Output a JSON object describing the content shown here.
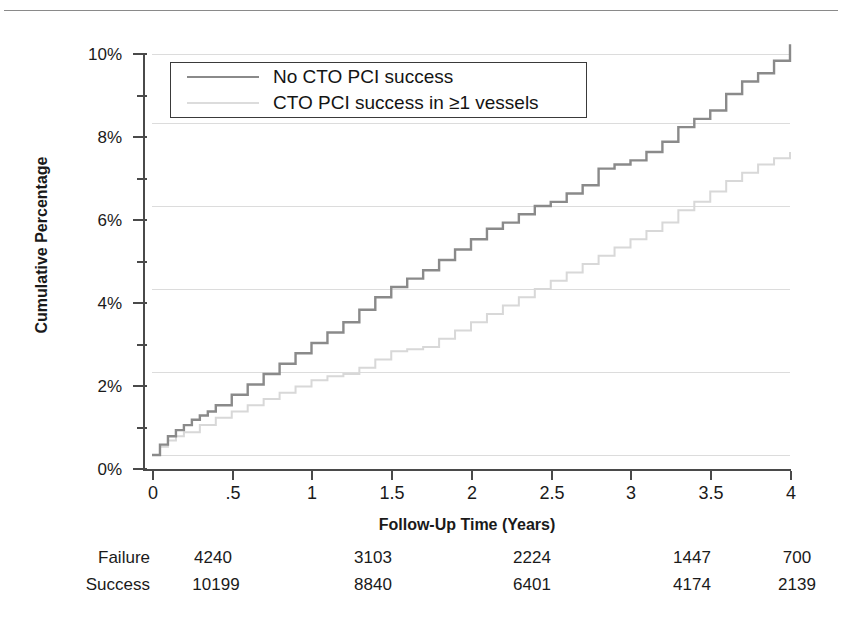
{
  "chart_data": {
    "type": "line",
    "title": "",
    "subtitle": "",
    "xlabel": "Follow-Up Time (Years)",
    "ylabel": "Cumulative Percentage",
    "xlim": [
      0,
      4
    ],
    "ylim": [
      0,
      10
    ],
    "grid": "horizontal-major-only",
    "legend_position": "top-left-inside",
    "x_ticks": [
      "0",
      ".5",
      "1",
      "1.5",
      "2",
      "2.5",
      "3",
      "3.5",
      "4"
    ],
    "x_tick_values": [
      0,
      0.5,
      1,
      1.5,
      2,
      2.5,
      3,
      3.5,
      4
    ],
    "y_ticks": [
      "0%",
      "2%",
      "4%",
      "6%",
      "8%",
      "10%"
    ],
    "y_tick_values": [
      0,
      2,
      4,
      6,
      8,
      10
    ],
    "y_minor_tick_values": [
      1,
      3,
      5,
      7,
      9
    ],
    "series": [
      {
        "name": "No CTO PCI success",
        "color": "#8a8a8a",
        "style": "step",
        "x": [
          0,
          0.05,
          0.1,
          0.15,
          0.2,
          0.25,
          0.3,
          0.35,
          0.4,
          0.5,
          0.6,
          0.7,
          0.8,
          0.9,
          1.0,
          1.1,
          1.2,
          1.3,
          1.4,
          1.5,
          1.6,
          1.7,
          1.8,
          1.9,
          2.0,
          2.1,
          2.2,
          2.3,
          2.4,
          2.5,
          2.6,
          2.7,
          2.8,
          2.9,
          3.0,
          3.1,
          3.2,
          3.3,
          3.4,
          3.5,
          3.6,
          3.7,
          3.8,
          3.9,
          4.0
        ],
        "values": [
          0.0,
          0.25,
          0.45,
          0.6,
          0.72,
          0.85,
          0.95,
          1.05,
          1.2,
          1.45,
          1.7,
          1.95,
          2.2,
          2.45,
          2.7,
          2.95,
          3.2,
          3.5,
          3.8,
          4.05,
          4.25,
          4.45,
          4.7,
          4.95,
          5.2,
          5.45,
          5.6,
          5.8,
          6.0,
          6.1,
          6.3,
          6.5,
          6.9,
          7.0,
          7.1,
          7.3,
          7.55,
          7.9,
          8.1,
          8.3,
          8.7,
          9.0,
          9.2,
          9.5,
          9.9
        ]
      },
      {
        "name": "CTO PCI success in ≥1 vessels",
        "color": "#d8d8d8",
        "style": "step",
        "x": [
          0,
          0.05,
          0.1,
          0.15,
          0.2,
          0.3,
          0.4,
          0.5,
          0.6,
          0.7,
          0.8,
          0.9,
          1.0,
          1.1,
          1.2,
          1.3,
          1.4,
          1.5,
          1.6,
          1.7,
          1.8,
          1.9,
          2.0,
          2.1,
          2.2,
          2.3,
          2.4,
          2.5,
          2.6,
          2.7,
          2.8,
          2.9,
          3.0,
          3.1,
          3.2,
          3.3,
          3.4,
          3.5,
          3.6,
          3.7,
          3.8,
          3.9,
          4.0
        ],
        "values": [
          0.0,
          0.2,
          0.35,
          0.45,
          0.55,
          0.72,
          0.9,
          1.05,
          1.2,
          1.35,
          1.5,
          1.65,
          1.8,
          1.9,
          1.95,
          2.1,
          2.3,
          2.5,
          2.55,
          2.6,
          2.8,
          3.0,
          3.2,
          3.4,
          3.6,
          3.8,
          4.0,
          4.2,
          4.4,
          4.6,
          4.8,
          5.0,
          5.2,
          5.4,
          5.6,
          5.9,
          6.1,
          6.35,
          6.6,
          6.8,
          7.0,
          7.15,
          7.3
        ]
      }
    ]
  },
  "legend": {
    "items": [
      {
        "label": "No CTO PCI success"
      },
      {
        "label": "CTO PCI success in ≥1 vessels"
      }
    ]
  },
  "risk_table": {
    "rows": [
      {
        "label": "Failure",
        "values": [
          "4240",
          "3103",
          "2224",
          "1447",
          "700"
        ]
      },
      {
        "label": "Success",
        "values": [
          "10199",
          "8840",
          "6401",
          "4174",
          "2139"
        ]
      }
    ]
  }
}
